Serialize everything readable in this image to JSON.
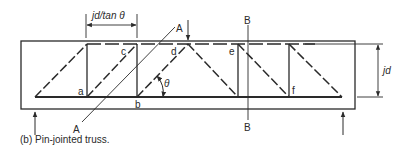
{
  "figure": {
    "caption": "(b) Pin-jointed truss.",
    "dimension_spacing_label": "jd/tan θ",
    "dimension_depth_label": "jd",
    "angle_label": "θ",
    "section_a": {
      "top_label": "A",
      "bottom_label": "A"
    },
    "section_b": {
      "top_label": "B",
      "bottom_label": "B"
    },
    "node_labels": {
      "a": "a",
      "b": "b",
      "c": "c",
      "d": "d",
      "e": "e",
      "f": "f"
    },
    "colors": {
      "line": "#2a2a2a",
      "background": "#ffffff"
    }
  }
}
